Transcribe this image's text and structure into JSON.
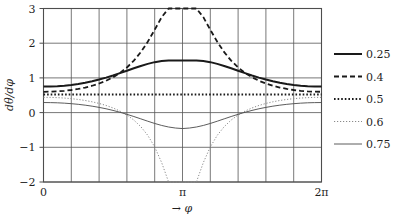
{
  "chart_data": {
    "type": "line",
    "title": "",
    "subtitle": "",
    "xlabel": "→  φ",
    "ylabel": "dθ/dφ",
    "xlim": [
      0,
      6.283185307179586
    ],
    "ylim": [
      -2,
      3
    ],
    "grid": true,
    "legend_position": "right",
    "x_ticks": [
      {
        "value": 0,
        "label": "0"
      },
      {
        "value": 3.141592653589793,
        "label": "π"
      },
      {
        "value": 6.283185307179586,
        "label": "2π"
      }
    ],
    "x_gridlines": [
      0,
      0.6283185307,
      1.2566370614,
      1.8849555922,
      2.5132741229,
      3.1415926536,
      3.7699111843,
      4.398229715,
      5.0265482457,
      5.6548667765,
      6.2831853072
    ],
    "y_ticks": [
      {
        "value": 3,
        "label": "3"
      },
      {
        "value": 2,
        "label": "2"
      },
      {
        "value": 1,
        "label": "1"
      },
      {
        "value": 0,
        "label": "0"
      },
      {
        "value": -1,
        "label": "−1"
      },
      {
        "value": -2,
        "label": "−2"
      }
    ],
    "y_gridlines": [
      3,
      2,
      1,
      0,
      -1,
      -2
    ],
    "x": [
      0.0,
      0.15707963,
      0.31415927,
      0.4712389,
      0.62831853,
      0.78539816,
      0.9424778,
      1.09955743,
      1.25663706,
      1.41371669,
      1.57079633,
      1.72787596,
      1.88495559,
      2.04203522,
      2.19911486,
      2.35619449,
      2.51327412,
      2.67035376,
      2.82743339,
      2.98451302,
      3.14159265,
      3.29867229,
      3.45575192,
      3.61283155,
      3.76991118,
      3.92699082,
      4.08407045,
      4.24115008,
      4.39822972,
      4.55530935,
      4.71238898,
      4.86946861,
      5.02654825,
      5.18362788,
      5.34070751,
      5.49778714,
      5.65486678,
      5.81194641,
      5.96902604,
      6.12610567,
      6.28318531
    ],
    "series": [
      {
        "name": "0.25",
        "label": "0.25",
        "style": "solid-thick",
        "color": "#1a1a1a",
        "width": 2.0,
        "dash": "",
        "values": [
          0.75,
          0.753,
          0.762,
          0.777,
          0.798,
          0.826,
          0.861,
          0.903,
          0.952,
          1.008,
          1.07,
          1.137,
          1.207,
          1.277,
          1.345,
          1.405,
          1.454,
          1.488,
          1.505,
          1.505,
          1.5,
          1.505,
          1.505,
          1.488,
          1.454,
          1.405,
          1.345,
          1.277,
          1.207,
          1.137,
          1.07,
          1.008,
          0.952,
          0.903,
          0.861,
          0.826,
          0.798,
          0.777,
          0.762,
          0.753,
          0.75
        ]
      },
      {
        "name": "0.4",
        "label": "0.4",
        "style": "dashed",
        "color": "#1a1a1a",
        "width": 1.8,
        "dash": "5,3",
        "values": [
          0.6,
          0.603,
          0.612,
          0.628,
          0.651,
          0.682,
          0.722,
          0.774,
          0.838,
          0.918,
          1.018,
          1.143,
          1.3,
          1.497,
          1.742,
          2.04,
          2.388,
          2.75,
          3.0,
          3.0,
          3.0,
          3.0,
          3.0,
          2.75,
          2.388,
          2.04,
          1.742,
          1.497,
          1.3,
          1.143,
          1.018,
          0.918,
          0.838,
          0.774,
          0.722,
          0.682,
          0.651,
          0.628,
          0.612,
          0.603,
          0.6
        ]
      },
      {
        "name": "0.5",
        "label": "0.5",
        "style": "dotted-thick",
        "color": "#1a1a1a",
        "width": 2.0,
        "dash": "1.6,2.0",
        "values": [
          0.52,
          0.52,
          0.52,
          0.52,
          0.52,
          0.52,
          0.52,
          0.52,
          0.52,
          0.52,
          0.52,
          0.52,
          0.52,
          0.52,
          0.52,
          0.52,
          0.52,
          0.52,
          0.52,
          0.52,
          0.52,
          0.52,
          0.52,
          0.52,
          0.52,
          0.52,
          0.52,
          0.52,
          0.52,
          0.52,
          0.52,
          0.52,
          0.52,
          0.52,
          0.52,
          0.52,
          0.52,
          0.52,
          0.52,
          0.52,
          0.52
        ]
      },
      {
        "name": "0.6",
        "label": "0.6",
        "style": "dotted-fine",
        "color": "#8a8a8a",
        "width": 1.0,
        "dash": "1.2,1.8",
        "values": [
          0.44,
          0.438,
          0.431,
          0.419,
          0.402,
          0.379,
          0.349,
          0.311,
          0.264,
          0.206,
          0.134,
          0.044,
          -0.069,
          -0.215,
          -0.405,
          -0.655,
          -0.99,
          -1.44,
          -2.0,
          -2.0,
          -2.0,
          -2.0,
          -2.0,
          -1.44,
          -0.99,
          -0.655,
          -0.405,
          -0.215,
          -0.069,
          0.044,
          0.134,
          0.206,
          0.264,
          0.311,
          0.349,
          0.379,
          0.402,
          0.419,
          0.431,
          0.438,
          0.44
        ]
      },
      {
        "name": "0.75",
        "label": "0.75",
        "style": "solid-thin",
        "color": "#4a4a4a",
        "width": 0.9,
        "dash": "",
        "values": [
          0.29,
          0.288,
          0.282,
          0.272,
          0.257,
          0.238,
          0.214,
          0.185,
          0.15,
          0.11,
          0.063,
          0.01,
          -0.049,
          -0.113,
          -0.18,
          -0.248,
          -0.313,
          -0.37,
          -0.415,
          -0.445,
          -0.46,
          -0.445,
          -0.415,
          -0.37,
          -0.313,
          -0.248,
          -0.18,
          -0.113,
          -0.049,
          0.01,
          0.063,
          0.11,
          0.15,
          0.185,
          0.214,
          0.238,
          0.257,
          0.272,
          0.282,
          0.288,
          0.29
        ]
      }
    ]
  },
  "legend": {
    "items": [
      {
        "label": "0.25"
      },
      {
        "label": "0.4"
      },
      {
        "label": "0.5"
      },
      {
        "label": "0.6"
      },
      {
        "label": "0.75"
      }
    ]
  },
  "axes": {
    "y_axis_title": "dθ/dφ",
    "x_axis_title": "φ",
    "x_axis_arrow": "→"
  },
  "colors": {
    "frame": "#4d4d4d",
    "grid": "#565656",
    "text": "#1f1f1f",
    "background": "#ffffff"
  }
}
